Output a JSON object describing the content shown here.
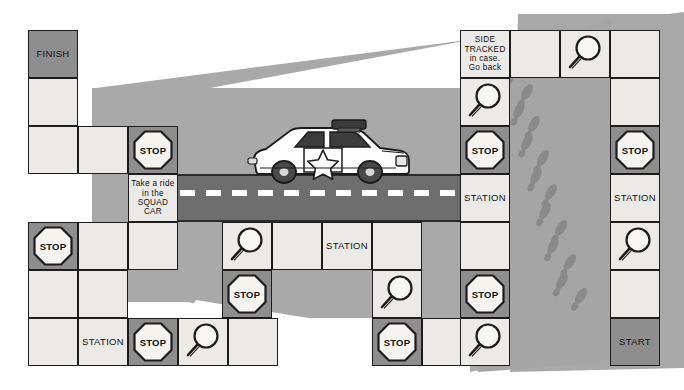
{
  "board": {
    "title": "Police detective board game track",
    "width": 684,
    "height": 390,
    "colors": {
      "cell_light": "#eceae6",
      "cell_dark": "#8e8e8e",
      "outline": "#1c1c1c",
      "plate_grey": "#a9a9a9",
      "plate_grey_dark": "#9a9a9a",
      "road_grey": "#6e6e6e",
      "road_dash": "#ffffff",
      "footprint": "#8a8a8a",
      "paper": "#ffffff"
    },
    "labels": {
      "finish": "FINISH",
      "start": "START",
      "station": "STATION",
      "stop": "STOP",
      "squad_car": "Take a ride\nin the\nSQUAD\nCAR",
      "side_tracked": "SIDE\nTRACKED\nin case.\nGo back"
    },
    "icons": {
      "magnifier": "magnifying-glass-icon",
      "stop_sign": "stop-sign-icon",
      "footprint": "footprint-icon",
      "police_car": "police-car-icon",
      "star_badge": "star-badge-icon"
    },
    "cells": [
      {
        "id": "finish",
        "x": 28,
        "y": 30,
        "w": 50,
        "h": 48,
        "tone": "dark",
        "kind": "text",
        "text": "FINISH"
      },
      {
        "id": "c-a2",
        "x": 28,
        "y": 78,
        "w": 50,
        "h": 48,
        "tone": "light",
        "kind": "blank",
        "text": ""
      },
      {
        "id": "c-a3",
        "x": 28,
        "y": 126,
        "w": 50,
        "h": 48,
        "tone": "light",
        "kind": "blank",
        "text": ""
      },
      {
        "id": "c-b3",
        "x": 78,
        "y": 126,
        "w": 50,
        "h": 48,
        "tone": "light",
        "kind": "blank",
        "text": ""
      },
      {
        "id": "stop-squad",
        "x": 128,
        "y": 126,
        "w": 50,
        "h": 48,
        "tone": "dark",
        "kind": "stop",
        "text": "STOP"
      },
      {
        "id": "squad-car",
        "x": 128,
        "y": 174,
        "w": 50,
        "h": 48,
        "tone": "light",
        "kind": "text-small",
        "text": "Take a ride\nin the\nSQUAD\nCAR"
      },
      {
        "id": "stop-left",
        "x": 28,
        "y": 222,
        "w": 50,
        "h": 48,
        "tone": "dark",
        "kind": "stop",
        "text": "STOP"
      },
      {
        "id": "c-b5",
        "x": 78,
        "y": 222,
        "w": 50,
        "h": 48,
        "tone": "light",
        "kind": "blank",
        "text": ""
      },
      {
        "id": "c-c5",
        "x": 128,
        "y": 222,
        "w": 50,
        "h": 48,
        "tone": "light",
        "kind": "blank",
        "text": ""
      },
      {
        "id": "c-a6",
        "x": 28,
        "y": 270,
        "w": 50,
        "h": 48,
        "tone": "light",
        "kind": "blank",
        "text": ""
      },
      {
        "id": "c-b6",
        "x": 78,
        "y": 270,
        "w": 50,
        "h": 48,
        "tone": "light",
        "kind": "blank",
        "text": ""
      },
      {
        "id": "c-a7",
        "x": 28,
        "y": 318,
        "w": 50,
        "h": 48,
        "tone": "light",
        "kind": "blank",
        "text": ""
      },
      {
        "id": "station-bl",
        "x": 78,
        "y": 318,
        "w": 50,
        "h": 48,
        "tone": "light",
        "kind": "text",
        "text": "STATION"
      },
      {
        "id": "stop-bl",
        "x": 128,
        "y": 318,
        "w": 50,
        "h": 48,
        "tone": "dark",
        "kind": "stop",
        "text": "STOP"
      },
      {
        "id": "mag-bl",
        "x": 178,
        "y": 318,
        "w": 50,
        "h": 48,
        "tone": "light",
        "kind": "magnifier",
        "text": ""
      },
      {
        "id": "c-e7",
        "x": 228,
        "y": 318,
        "w": 50,
        "h": 48,
        "tone": "light",
        "kind": "blank",
        "text": ""
      },
      {
        "id": "mag-mid",
        "x": 222,
        "y": 222,
        "w": 50,
        "h": 48,
        "tone": "light",
        "kind": "magnifier",
        "text": ""
      },
      {
        "id": "c-mid2",
        "x": 272,
        "y": 222,
        "w": 50,
        "h": 48,
        "tone": "light",
        "kind": "blank",
        "text": ""
      },
      {
        "id": "station-mid",
        "x": 322,
        "y": 222,
        "w": 50,
        "h": 48,
        "tone": "light",
        "kind": "text",
        "text": "STATION"
      },
      {
        "id": "c-mid4",
        "x": 372,
        "y": 222,
        "w": 50,
        "h": 48,
        "tone": "light",
        "kind": "blank",
        "text": ""
      },
      {
        "id": "stop-mid",
        "x": 222,
        "y": 270,
        "w": 50,
        "h": 48,
        "tone": "dark",
        "kind": "stop",
        "text": "STOP"
      },
      {
        "id": "mag-mid2",
        "x": 372,
        "y": 270,
        "w": 50,
        "h": 48,
        "tone": "light",
        "kind": "magnifier",
        "text": ""
      },
      {
        "id": "stop-mid2",
        "x": 372,
        "y": 318,
        "w": 50,
        "h": 48,
        "tone": "dark",
        "kind": "stop",
        "text": "STOP"
      },
      {
        "id": "c-mb2",
        "x": 422,
        "y": 318,
        "w": 50,
        "h": 48,
        "tone": "light",
        "kind": "blank",
        "text": ""
      },
      {
        "id": "side-tracked",
        "x": 460,
        "y": 30,
        "w": 50,
        "h": 48,
        "tone": "light",
        "kind": "text-small",
        "text": "SIDE\nTRACKED\nin case.\nGo back"
      },
      {
        "id": "c-r1b",
        "x": 510,
        "y": 30,
        "w": 50,
        "h": 48,
        "tone": "light",
        "kind": "blank",
        "text": ""
      },
      {
        "id": "mag-top",
        "x": 560,
        "y": 30,
        "w": 50,
        "h": 48,
        "tone": "light",
        "kind": "magnifier",
        "text": ""
      },
      {
        "id": "c-r1d",
        "x": 610,
        "y": 30,
        "w": 50,
        "h": 48,
        "tone": "light",
        "kind": "blank",
        "text": ""
      },
      {
        "id": "mag-r2",
        "x": 460,
        "y": 78,
        "w": 50,
        "h": 48,
        "tone": "light",
        "kind": "magnifier",
        "text": ""
      },
      {
        "id": "c-r2d",
        "x": 610,
        "y": 78,
        "w": 50,
        "h": 48,
        "tone": "light",
        "kind": "blank",
        "text": ""
      },
      {
        "id": "stop-r3",
        "x": 460,
        "y": 126,
        "w": 50,
        "h": 48,
        "tone": "dark",
        "kind": "stop",
        "text": "STOP"
      },
      {
        "id": "stop-r3d",
        "x": 610,
        "y": 126,
        "w": 50,
        "h": 48,
        "tone": "dark",
        "kind": "stop",
        "text": "STOP"
      },
      {
        "id": "station-r4",
        "x": 460,
        "y": 174,
        "w": 50,
        "h": 48,
        "tone": "light",
        "kind": "text",
        "text": "STATION"
      },
      {
        "id": "station-r4d",
        "x": 610,
        "y": 174,
        "w": 50,
        "h": 48,
        "tone": "light",
        "kind": "text",
        "text": "STATION"
      },
      {
        "id": "c-r5",
        "x": 460,
        "y": 222,
        "w": 50,
        "h": 48,
        "tone": "light",
        "kind": "blank",
        "text": ""
      },
      {
        "id": "mag-r5d",
        "x": 610,
        "y": 222,
        "w": 50,
        "h": 48,
        "tone": "light",
        "kind": "magnifier",
        "text": ""
      },
      {
        "id": "stop-r6",
        "x": 460,
        "y": 270,
        "w": 50,
        "h": 48,
        "tone": "dark",
        "kind": "stop",
        "text": "STOP"
      },
      {
        "id": "c-r6d",
        "x": 610,
        "y": 270,
        "w": 50,
        "h": 48,
        "tone": "light",
        "kind": "blank",
        "text": ""
      },
      {
        "id": "mag-r7",
        "x": 460,
        "y": 318,
        "w": 50,
        "h": 48,
        "tone": "light",
        "kind": "magnifier",
        "text": ""
      },
      {
        "id": "start",
        "x": 610,
        "y": 318,
        "w": 50,
        "h": 48,
        "tone": "dark",
        "kind": "text",
        "text": "START"
      }
    ],
    "footprints": [
      {
        "x": 516,
        "y": 62,
        "r": 28
      },
      {
        "x": 509,
        "y": 78,
        "r": 26
      },
      {
        "x": 527,
        "y": 92,
        "r": 30
      },
      {
        "x": 519,
        "y": 110,
        "r": 26
      },
      {
        "x": 534,
        "y": 124,
        "r": 30
      },
      {
        "x": 527,
        "y": 142,
        "r": 27
      },
      {
        "x": 543,
        "y": 158,
        "r": 31
      },
      {
        "x": 536,
        "y": 176,
        "r": 27
      },
      {
        "x": 551,
        "y": 192,
        "r": 31
      },
      {
        "x": 545,
        "y": 211,
        "r": 28
      },
      {
        "x": 561,
        "y": 228,
        "r": 32
      },
      {
        "x": 553,
        "y": 246,
        "r": 28
      },
      {
        "x": 570,
        "y": 262,
        "r": 33
      },
      {
        "x": 562,
        "y": 281,
        "r": 29
      },
      {
        "x": 581,
        "y": 296,
        "r": 34
      }
    ]
  }
}
